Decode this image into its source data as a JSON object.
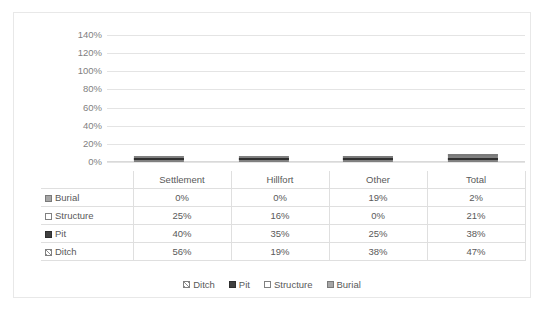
{
  "chart_data": {
    "type": "bar",
    "subtype": "stacked-column",
    "title": "",
    "xlabel": "",
    "ylabel": "",
    "ylim": [
      0,
      140
    ],
    "ytick_labels": [
      "0%",
      "20%",
      "40%",
      "60%",
      "80%",
      "100%",
      "120%",
      "140%"
    ],
    "ytick_values": [
      0,
      20,
      40,
      60,
      80,
      100,
      120,
      140
    ],
    "grid": true,
    "legend_position": "bottom",
    "categories": [
      "Settlement",
      "Hillfort",
      "Other",
      "Total"
    ],
    "series": [
      {
        "name": "Ditch",
        "values": [
          56,
          19,
          38,
          47
        ],
        "labels": [
          "56%",
          "19%",
          "38%",
          "47%"
        ],
        "color": "#ffffff",
        "pattern": "diagonal-hatch"
      },
      {
        "name": "Pit",
        "values": [
          40,
          35,
          25,
          38
        ],
        "labels": [
          "40%",
          "35%",
          "25%",
          "38%"
        ],
        "color": "#404040",
        "pattern": "solid"
      },
      {
        "name": "Structure",
        "values": [
          25,
          16,
          0,
          21
        ],
        "labels": [
          "25%",
          "16%",
          "0%",
          "21%"
        ],
        "color": "#ffffff",
        "pattern": "solid"
      },
      {
        "name": "Burial",
        "values": [
          0,
          0,
          19,
          2
        ],
        "labels": [
          "0%",
          "0%",
          "19%",
          "2%"
        ],
        "color": "#a6a6a6",
        "pattern": "solid"
      }
    ],
    "totals": [
      121,
      70,
      82,
      108
    ]
  },
  "table": {
    "corner": "",
    "column_headers": [
      "Settlement",
      "Hillfort",
      "Other",
      "Total"
    ],
    "rows": [
      {
        "label": "Burial",
        "swatch": "burial-swatch",
        "values": [
          "0%",
          "0%",
          "19%",
          "2%"
        ]
      },
      {
        "label": "Structure",
        "swatch": "structure-swatch",
        "values": [
          "25%",
          "16%",
          "0%",
          "21%"
        ]
      },
      {
        "label": "Pit",
        "swatch": "pit-swatch",
        "values": [
          "40%",
          "35%",
          "25%",
          "38%"
        ]
      },
      {
        "label": "Ditch",
        "swatch": "ditch-swatch",
        "values": [
          "56%",
          "19%",
          "38%",
          "47%"
        ]
      }
    ]
  },
  "legend": {
    "items": [
      {
        "label": "Ditch",
        "swatch": "ditch-swatch"
      },
      {
        "label": "Pit",
        "swatch": "pit-swatch"
      },
      {
        "label": "Structure",
        "swatch": "structure-swatch"
      },
      {
        "label": "Burial",
        "swatch": "burial-swatch"
      }
    ]
  },
  "colors": {
    "ditch": "#ffffff",
    "pit": "#404040",
    "structure": "#ffffff",
    "burial": "#a6a6a6",
    "gridline": "#e4e4e4",
    "text": "#595959",
    "frame": "#e8e8e8"
  }
}
